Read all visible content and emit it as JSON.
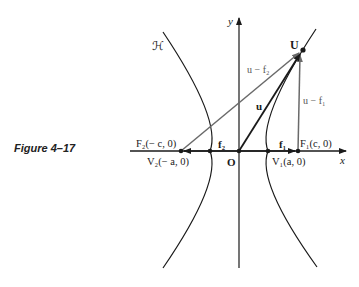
{
  "caption": "Figure 4–17",
  "labels": {
    "curve": "ℋ",
    "y_axis": "y",
    "x_axis": "x",
    "origin": "O",
    "point_U": "U",
    "vec_u": "u",
    "vec_u_minus_f2": "u − f₂",
    "vec_u_minus_f1": "u − f₁",
    "vec_f2": "f₂",
    "vec_f1": "f₁",
    "focus_F2": "F₂(− c, 0)",
    "focus_F1": "F₁(c, 0)",
    "vertex_V2": "V₂(− a, 0)",
    "vertex_V1": "V₁(a, 0)"
  },
  "colors": {
    "ink": "#1a1a1a",
    "gray_line": "#6a6a6a",
    "background": "#ffffff"
  }
}
